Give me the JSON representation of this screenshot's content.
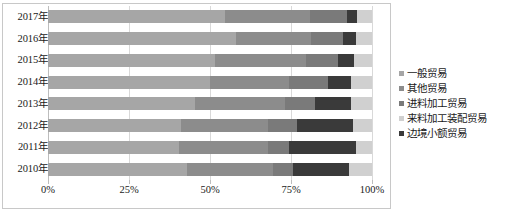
{
  "chart_data": {
    "type": "bar",
    "orientation": "horizontal",
    "stacked": true,
    "normalized": true,
    "title": "",
    "xlabel": "",
    "ylabel": "",
    "xlim": [
      0,
      100
    ],
    "xticks": [
      0,
      25,
      50,
      75,
      100
    ],
    "xtick_labels": [
      "0%",
      "25%",
      "50%",
      "75%",
      "100%"
    ],
    "categories": [
      "2017年",
      "2016年",
      "2015年",
      "2014年",
      "2013年",
      "2012年",
      "2011年",
      "2010年"
    ],
    "grid": true,
    "grid_axis": "x",
    "legend_position": "right",
    "series": [
      {
        "name": "一般贸易",
        "color": "#a6a6a6",
        "values": [
          54.6,
          58.0,
          51.5,
          50.0,
          45.5,
          41.0,
          40.5,
          43.0
        ]
      },
      {
        "name": "其他贸易",
        "color": "#8c8c8c",
        "values": [
          26.2,
          23.2,
          28.0,
          24.5,
          27.5,
          27.0,
          27.5,
          26.5
        ]
      },
      {
        "name": "进料加工贸易",
        "color": "#7a7a7a",
        "values": [
          11.5,
          10.0,
          10.0,
          12.0,
          9.5,
          9.0,
          6.5,
          6.0
        ]
      },
      {
        "name": "来料加工装配贸易",
        "color": "#3a3a3a",
        "values": [
          3.2,
          4.0,
          5.0,
          7.0,
          11.0,
          17.0,
          20.5,
          17.5
        ]
      },
      {
        "name": "边境小额贸易",
        "color": "#d0d0d0",
        "values": [
          4.5,
          4.8,
          5.5,
          6.5,
          6.5,
          6.0,
          5.0,
          7.0
        ]
      }
    ]
  },
  "legend": {
    "items": [
      {
        "label": "一般贸易",
        "color": "#a6a6a6"
      },
      {
        "label": "其他贸易",
        "color": "#8c8c8c"
      },
      {
        "label": "进料加工贸易",
        "color": "#7a7a7a"
      },
      {
        "label": "来料加工装配贸易",
        "color": "#d0d0d0"
      },
      {
        "label": "边境小额贸易",
        "color": "#3a3a3a"
      }
    ]
  }
}
